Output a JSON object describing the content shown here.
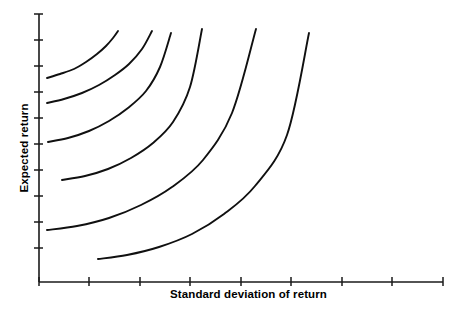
{
  "chart_data": {
    "type": "line",
    "title": "",
    "subtitle": "",
    "xlabel": "Standard deviation of return",
    "ylabel": "Expected return",
    "annotations": [],
    "legend": [],
    "legend_position": "none",
    "grid": false,
    "axis": {
      "x": {
        "label": "Standard deviation of return",
        "tick_labels": [],
        "n_ticks": 9,
        "tick_positions_px": [
          39,
          89,
          140,
          190,
          241,
          291,
          342,
          392,
          443
        ],
        "origin_px": 39,
        "end_px": 443,
        "baseline_y_px": 282,
        "direction": "increasing right",
        "range": [
          0,
          1
        ]
      },
      "y": {
        "label": "Expected return",
        "tick_labels": [],
        "n_ticks": 10,
        "tick_positions_px": [
          14,
          40,
          66,
          92,
          118,
          144,
          170,
          196,
          222,
          248
        ],
        "top_px": 14,
        "baseline_px": 282,
        "axis_x_px": 39,
        "direction": "increasing up",
        "range": [
          0,
          1
        ]
      }
    },
    "series": [
      {
        "name": "indifference-curve-1",
        "start_px": [
          47,
          78
        ],
        "end_px": [
          118,
          31
        ],
        "points_px": [
          [
            47,
            78
          ],
          [
            60,
            74
          ],
          [
            74,
            69
          ],
          [
            86,
            62
          ],
          [
            97,
            54
          ],
          [
            106,
            46
          ],
          [
            113,
            38
          ],
          [
            118,
            31
          ]
        ]
      },
      {
        "name": "indifference-curve-2",
        "start_px": [
          47,
          103
        ],
        "end_px": [
          152,
          31
        ],
        "points_px": [
          [
            47,
            103
          ],
          [
            64,
            99
          ],
          [
            82,
            93
          ],
          [
            99,
            85
          ],
          [
            115,
            75
          ],
          [
            129,
            64
          ],
          [
            142,
            49
          ],
          [
            152,
            31
          ]
        ]
      },
      {
        "name": "indifference-curve-3",
        "start_px": [
          48,
          142
        ],
        "end_px": [
          171,
          33
        ],
        "points_px": [
          [
            48,
            142
          ],
          [
            68,
            138
          ],
          [
            89,
            131
          ],
          [
            109,
            121
          ],
          [
            128,
            108
          ],
          [
            146,
            91
          ],
          [
            160,
            67
          ],
          [
            171,
            33
          ]
        ]
      },
      {
        "name": "indifference-curve-4",
        "start_px": [
          62,
          180
        ],
        "end_px": [
          202,
          29
        ],
        "points_px": [
          [
            62,
            180
          ],
          [
            85,
            176
          ],
          [
            108,
            169
          ],
          [
            131,
            158
          ],
          [
            153,
            143
          ],
          [
            173,
            122
          ],
          [
            190,
            87
          ],
          [
            202,
            29
          ]
        ]
      },
      {
        "name": "indifference-curve-5",
        "start_px": [
          47,
          230
        ],
        "end_px": [
          256,
          29
        ],
        "points_px": [
          [
            47,
            230
          ],
          [
            77,
            226
          ],
          [
            109,
            218
          ],
          [
            141,
            205
          ],
          [
            172,
            187
          ],
          [
            203,
            160
          ],
          [
            232,
            113
          ],
          [
            256,
            29
          ]
        ]
      },
      {
        "name": "indifference-curve-6",
        "start_px": [
          98,
          259
        ],
        "end_px": [
          309,
          33
        ],
        "points_px": [
          [
            98,
            259
          ],
          [
            127,
            255
          ],
          [
            159,
            247
          ],
          [
            192,
            234
          ],
          [
            224,
            214
          ],
          [
            255,
            186
          ],
          [
            287,
            135
          ],
          [
            309,
            33
          ]
        ]
      }
    ],
    "colors": {
      "curve": "#101010",
      "axis": "#1a1a1a",
      "background": "#ffffff",
      "text": "#000000"
    }
  }
}
